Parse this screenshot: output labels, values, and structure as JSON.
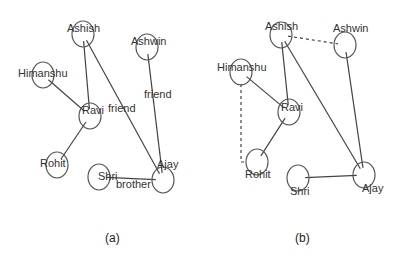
{
  "graphs": [
    {
      "id": "a",
      "caption": "(a)",
      "caption_pos": [
        105,
        242
      ],
      "nodes": [
        {
          "name": "Ashish",
          "cx": 83,
          "cy": 34,
          "lx": 67,
          "ly": 32
        },
        {
          "name": "Ashwin",
          "cx": 147,
          "cy": 47,
          "lx": 131,
          "ly": 45
        },
        {
          "name": "Himanshu",
          "cx": 43,
          "cy": 75,
          "lx": 18,
          "ly": 77
        },
        {
          "name": "Ravi",
          "cx": 90,
          "cy": 116,
          "lx": 82,
          "ly": 114
        },
        {
          "name": "Rohit",
          "cx": 57,
          "cy": 165,
          "lx": 40,
          "ly": 167
        },
        {
          "name": "Shri",
          "cx": 99,
          "cy": 177,
          "lx": 98,
          "ly": 180
        },
        {
          "name": "Ajay",
          "cx": 163,
          "cy": 180,
          "lx": 157,
          "ly": 168
        }
      ],
      "edges": [
        {
          "from": "Ashish",
          "to": "Ravi",
          "style": "solid",
          "label": ""
        },
        {
          "from": "Ashish",
          "to": "Ajay",
          "style": "solid",
          "label": "friend",
          "lx": 108,
          "ly": 112
        },
        {
          "from": "Himanshu",
          "to": "Ravi",
          "style": "solid",
          "label": ""
        },
        {
          "from": "Ravi",
          "to": "Rohit",
          "style": "solid",
          "label": ""
        },
        {
          "from": "Ashwin",
          "to": "Ajay",
          "style": "solid",
          "label": "friend",
          "lx": 144,
          "ly": 98
        },
        {
          "from": "Shri",
          "to": "Ajay",
          "style": "solid",
          "label": "brother",
          "lx": 116,
          "ly": 188
        }
      ]
    },
    {
      "id": "b",
      "caption": "(b)",
      "caption_pos": [
        295,
        242
      ],
      "nodes": [
        {
          "name": "Ashish",
          "cx": 281,
          "cy": 35,
          "lx": 265,
          "ly": 30
        },
        {
          "name": "Ashwin",
          "cx": 345,
          "cy": 45,
          "lx": 333,
          "ly": 32
        },
        {
          "name": "Himanshu",
          "cx": 241,
          "cy": 72,
          "lx": 217,
          "ly": 71
        },
        {
          "name": "Ravi",
          "cx": 289,
          "cy": 112,
          "lx": 281,
          "ly": 111
        },
        {
          "name": "Rohit",
          "cx": 257,
          "cy": 162,
          "lx": 245,
          "ly": 178
        },
        {
          "name": "Shri",
          "cx": 298,
          "cy": 178,
          "lx": 290,
          "ly": 195
        },
        {
          "name": "Ajay",
          "cx": 364,
          "cy": 175,
          "lx": 362,
          "ly": 192
        }
      ],
      "edges": [
        {
          "from": "Ashish",
          "to": "Ashwin",
          "style": "dashed",
          "label": ""
        },
        {
          "from": "Ashish",
          "to": "Ravi",
          "style": "solid",
          "label": ""
        },
        {
          "from": "Ashish",
          "to": "Ajay",
          "style": "solid",
          "label": ""
        },
        {
          "from": "Himanshu",
          "to": "Ravi",
          "style": "solid",
          "label": ""
        },
        {
          "from": "Himanshu",
          "to": "Rohit",
          "style": "dashed-elbow",
          "label": ""
        },
        {
          "from": "Ravi",
          "to": "Rohit",
          "style": "solid",
          "label": ""
        },
        {
          "from": "Ashwin",
          "to": "Ajay",
          "style": "solid",
          "label": ""
        },
        {
          "from": "Shri",
          "to": "Ajay",
          "style": "solid",
          "label": ""
        }
      ]
    }
  ],
  "node_radius": 12
}
